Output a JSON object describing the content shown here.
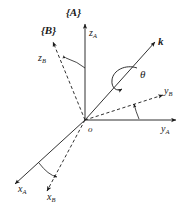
{
  "figure": {
    "title_none": "",
    "origin_label": "o",
    "frames": [
      {
        "id": "A",
        "label": "{A}",
        "type": "solid"
      },
      {
        "id": "B",
        "label": "{B}",
        "type": "dashed"
      }
    ],
    "axes": [
      {
        "name": "z_A",
        "base": "z",
        "sub": "A",
        "style": "solid",
        "label": "z"
      },
      {
        "name": "z_B",
        "base": "z",
        "sub": "B",
        "style": "dashed",
        "label": "z"
      },
      {
        "name": "y_A",
        "base": "y",
        "sub": "A",
        "style": "solid",
        "label": "y"
      },
      {
        "name": "y_B",
        "base": "y",
        "sub": "B",
        "style": "dashed",
        "label": "y"
      },
      {
        "name": "x_A",
        "base": "x",
        "sub": "A",
        "style": "solid",
        "label": "x"
      },
      {
        "name": "x_B",
        "base": "x",
        "sub": "B",
        "style": "dashed",
        "label": "x"
      }
    ],
    "vector": {
      "name": "k",
      "label": "k",
      "style": "solid"
    },
    "angle": {
      "name": "theta",
      "label": "θ"
    },
    "colors": {
      "line": "#1a1a1a",
      "background": "#ffffff"
    }
  }
}
